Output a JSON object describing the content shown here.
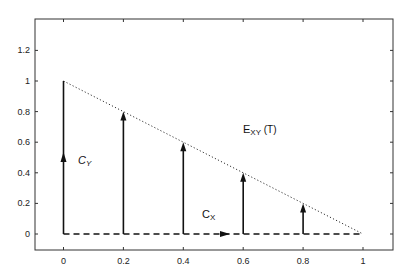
{
  "chart_data": {
    "type": "line",
    "title": "",
    "xlabel": "",
    "ylabel": "",
    "xlim": [
      -0.1,
      1.1
    ],
    "ylim": [
      -0.1,
      1.4
    ],
    "grid": false,
    "x_ticks": [
      0,
      0.2,
      0.4,
      0.6,
      0.8,
      1
    ],
    "x_tick_labels": [
      "0",
      "0.2",
      "0.4",
      "0.6",
      "0.8",
      "1"
    ],
    "y_ticks": [
      0,
      0.2,
      0.4,
      0.6,
      0.8,
      1,
      1.2
    ],
    "y_tick_labels": [
      "0",
      "0.2",
      "0.4",
      "0.6",
      "0.8",
      "1",
      "1.2"
    ],
    "series": [
      {
        "name": "E_XY(T)",
        "style": "dotted",
        "x": [
          0,
          1
        ],
        "y": [
          1,
          0
        ]
      },
      {
        "name": "C_X",
        "style": "dashed",
        "x": [
          0,
          1
        ],
        "y": [
          0,
          0
        ],
        "arrow_at": 0.545,
        "arrow_direction": "right"
      },
      {
        "name": "C_Y",
        "style": "solid",
        "x": [
          0,
          0
        ],
        "y": [
          0,
          1
        ],
        "arrow_at": 0.5,
        "arrow_direction": "up"
      },
      {
        "name": "vertical arrows",
        "style": "solid-arrow",
        "x": [
          0.2,
          0.4,
          0.6,
          0.8
        ],
        "y_from": [
          0,
          0,
          0,
          0
        ],
        "y_to": [
          0.8,
          0.6,
          0.4,
          0.2
        ]
      }
    ],
    "annotations": [
      {
        "text": "E_XY (T)",
        "x": 0.63,
        "y": 0.67
      },
      {
        "text": "C_Y",
        "x": 0.06,
        "y": 0.48
      },
      {
        "text": "C_X",
        "x": 0.5,
        "y": 0.07
      }
    ]
  },
  "labels": {
    "exy_main": "E",
    "exy_sub": "XY",
    "exy_tail": " (T)",
    "cy_main": "C",
    "cy_sub": "Y",
    "cx_main": "C",
    "cx_sub": "X"
  }
}
